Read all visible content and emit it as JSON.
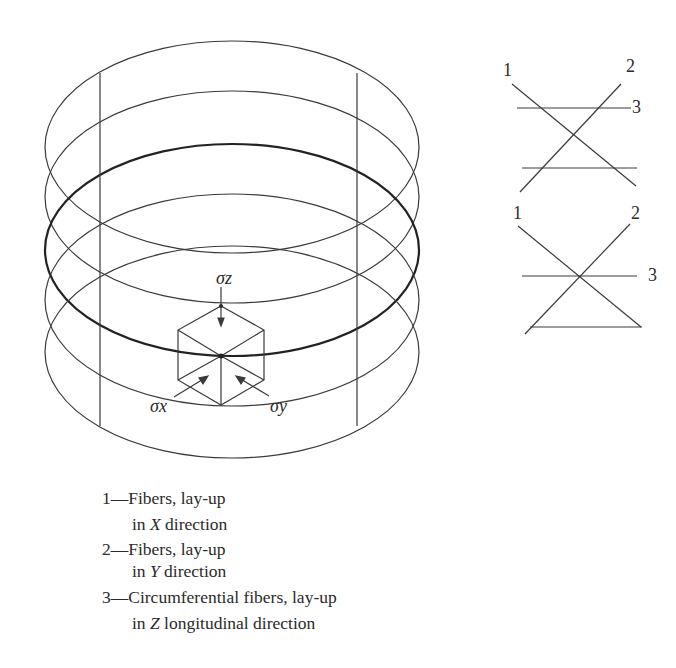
{
  "diagram": {
    "cylinder": {
      "stress_labels": {
        "z": "σz",
        "x": "σx",
        "y": "σy"
      }
    },
    "layup_schematic_top": {
      "labels": [
        "1",
        "2",
        "3"
      ]
    },
    "layup_schematic_bottom": {
      "labels": [
        "1",
        "2",
        "3"
      ]
    }
  },
  "legend": {
    "items": [
      {
        "number": "1",
        "line1": "1—Fibers, lay-up",
        "line2_prefix": "in ",
        "axis": "X",
        "line2_suffix": " direction"
      },
      {
        "number": "2",
        "line1": "2—Fibers, lay-up",
        "line2_prefix": "in ",
        "axis": "Y",
        "line2_suffix": " direction"
      },
      {
        "number": "3",
        "line1": "3—Circumferential fibers, lay-up",
        "line2_prefix": "in ",
        "axis": "Z",
        "line2_suffix": " longitudinal direction"
      }
    ]
  },
  "colors": {
    "line": "#3a3a3a",
    "background": "#ffffff"
  }
}
